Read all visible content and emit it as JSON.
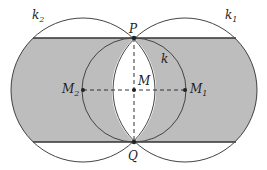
{
  "diagram": {
    "colors": {
      "shade": "#bdbdbd",
      "line": "#333333",
      "background": "#ffffff"
    },
    "points": {
      "P": {
        "label": "P",
        "x": 134,
        "y": 38
      },
      "Q": {
        "label": "Q",
        "x": 134,
        "y": 142
      },
      "M": {
        "label": "M",
        "x": 134,
        "y": 90
      },
      "M1": {
        "label": "M",
        "sub": "1",
        "x": 185,
        "y": 90
      },
      "M2": {
        "label": "M",
        "sub": "2",
        "x": 83,
        "y": 90
      }
    },
    "circles": {
      "k1": {
        "label": "k",
        "sub": "1",
        "cx": 185,
        "cy": 90,
        "r": 72
      },
      "k2": {
        "label": "k",
        "sub": "2",
        "cx": 83,
        "cy": 90,
        "r": 72
      },
      "k": {
        "label": "k",
        "cx": 134,
        "cy": 90,
        "r": 52
      }
    }
  }
}
